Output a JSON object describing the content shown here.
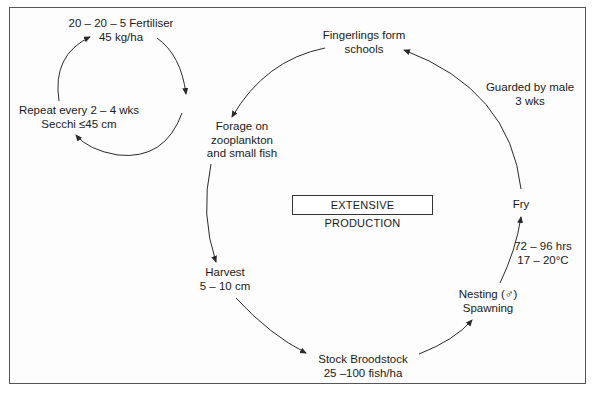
{
  "title": "EXTENSIVE PRODUCTION",
  "fertiliser_loop": {
    "fertiliser": [
      "20 – 20 – 5 Fertiliser",
      "45 kg/ha"
    ],
    "repeat": [
      "Repeat every 2 – 4 wks",
      "Secchi ≤45 cm"
    ]
  },
  "cycle": {
    "fingerlings": [
      "Fingerlings form",
      "schools"
    ],
    "forage": [
      "Forage on",
      "zooplankton",
      "and small fish"
    ],
    "harvest": [
      "Harvest",
      "5 – 10 cm"
    ],
    "stock": [
      "Stock Broodstock",
      "25 –100 fish/ha"
    ],
    "nesting": [
      "Nesting (♂)",
      "Spawning"
    ],
    "incubation": [
      "72 – 96 hrs",
      "17 – 20°C"
    ],
    "fry": [
      "Fry"
    ],
    "guarded": [
      "Guarded by male",
      "3 wks"
    ]
  },
  "colors": {
    "line": "#2a2a2a",
    "border": "#555555"
  }
}
